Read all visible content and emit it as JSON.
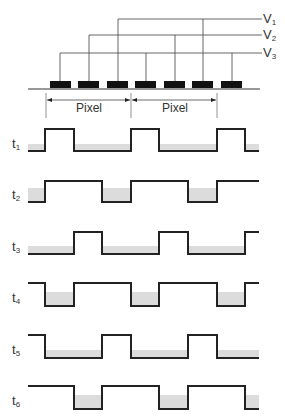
{
  "figure": {
    "voltage_bus": {
      "lines": [
        {
          "name": "V",
          "sub": "1",
          "y": 19,
          "taps_x": [
            118,
            203
          ]
        },
        {
          "name": "V",
          "sub": "2",
          "y": 35,
          "taps_x": [
            89,
            175
          ]
        },
        {
          "name": "V",
          "sub": "3",
          "y": 53,
          "taps_x": [
            60,
            146,
            232
          ]
        }
      ],
      "bus_start_x": {
        "V1": 118,
        "V2": 89,
        "V3": 60
      },
      "bus_end_x": 262,
      "label_x": 264
    },
    "electrodes": {
      "y": 81,
      "height": 7,
      "width": 21,
      "x": [
        50,
        78,
        107,
        135,
        164,
        192,
        221
      ]
    },
    "substrate_line": {
      "x1": 28,
      "x2": 260,
      "y": 89
    },
    "pixel_dimension": {
      "ticks_x": [
        46,
        131,
        217
      ],
      "arrow_y": 100,
      "labels": [
        "Pixel",
        "Pixel"
      ]
    },
    "waveforms": {
      "start_x": 28,
      "end_x": 259,
      "edges_x": [
        45,
        74,
        102,
        131,
        159,
        188,
        217,
        245
      ],
      "shade_color": "#dcdcdc",
      "line_color": "#222222",
      "rows": [
        {
          "label": "t",
          "sub": "1",
          "high_y": 129,
          "low_y": 151,
          "shade_top": 144,
          "label_y": 137,
          "levels": [
            "L",
            "H",
            "L",
            "L",
            "H",
            "L",
            "L",
            "H",
            "L"
          ]
        },
        {
          "label": "t",
          "sub": "2",
          "high_y": 181,
          "low_y": 202,
          "shade_top": 188,
          "label_y": 188,
          "levels": [
            "L",
            "H",
            "H",
            "L",
            "H",
            "H",
            "L",
            "H",
            "H"
          ]
        },
        {
          "label": "t",
          "sub": "3",
          "high_y": 232,
          "low_y": 254,
          "shade_top": 246,
          "label_y": 240,
          "levels": [
            "L",
            "L",
            "H",
            "L",
            "L",
            "H",
            "L",
            "L",
            "H"
          ]
        },
        {
          "label": "t",
          "sub": "4",
          "high_y": 283,
          "low_y": 306,
          "shade_top": 292,
          "label_y": 291,
          "levels": [
            "H",
            "L",
            "H",
            "H",
            "L",
            "H",
            "H",
            "L",
            "H"
          ]
        },
        {
          "label": "t",
          "sub": "5",
          "high_y": 335,
          "low_y": 358,
          "shade_top": 350,
          "label_y": 343,
          "levels": [
            "H",
            "L",
            "L",
            "H",
            "L",
            "L",
            "H",
            "L",
            "L"
          ]
        },
        {
          "label": "t",
          "sub": "6",
          "high_y": 386,
          "low_y": 409,
          "shade_top": 395,
          "label_y": 394,
          "levels": [
            "H",
            "H",
            "L",
            "H",
            "H",
            "L",
            "H",
            "H",
            "L"
          ]
        }
      ]
    },
    "caption": ""
  }
}
